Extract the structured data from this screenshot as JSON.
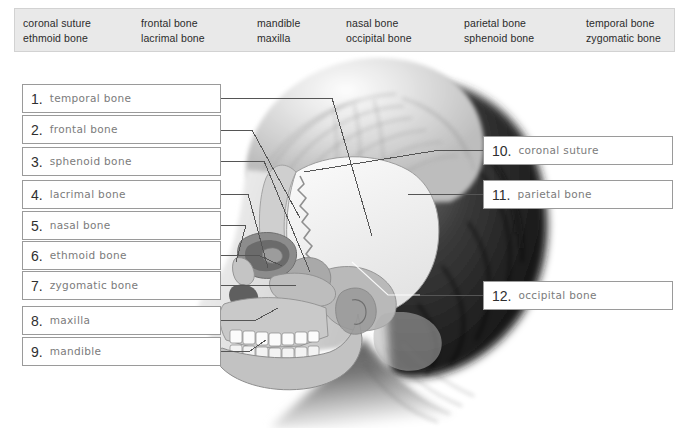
{
  "word_bank": {
    "columns": [
      {
        "x": 22,
        "words": [
          "coronal suture",
          "ethmoid bone"
        ]
      },
      {
        "x": 140,
        "words": [
          "frontal bone",
          "lacrimal bone"
        ]
      },
      {
        "x": 256,
        "words": [
          "mandible",
          "maxilla"
        ]
      },
      {
        "x": 345,
        "words": [
          "nasal bone",
          "occipital bone"
        ]
      },
      {
        "x": 463,
        "words": [
          "parietal bone",
          "sphenoid bone"
        ]
      },
      {
        "x": 585,
        "words": [
          "temporal bone",
          "zygomatic bone"
        ]
      }
    ]
  },
  "answers": {
    "left": [
      {
        "num": "1.",
        "text": "temporal bone",
        "x": 22,
        "y": 84,
        "w": 199,
        "h": 29
      },
      {
        "num": "2.",
        "text": "frontal bone",
        "x": 22,
        "y": 115,
        "w": 199,
        "h": 29
      },
      {
        "num": "3.",
        "text": "sphenoid bone",
        "x": 22,
        "y": 147,
        "w": 199,
        "h": 29
      },
      {
        "num": "4.",
        "text": "lacrimal bone",
        "x": 22,
        "y": 180,
        "w": 199,
        "h": 29
      },
      {
        "num": "5.",
        "text": "nasal bone",
        "x": 22,
        "y": 211,
        "w": 199,
        "h": 29
      },
      {
        "num": "6.",
        "text": "ethmoid bone",
        "x": 22,
        "y": 241,
        "w": 199,
        "h": 29
      },
      {
        "num": "7.",
        "text": "zygomatic bone",
        "x": 22,
        "y": 271,
        "w": 199,
        "h": 29
      },
      {
        "num": "8.",
        "text": "maxilla",
        "x": 22,
        "y": 306,
        "w": 199,
        "h": 29
      },
      {
        "num": "9.",
        "text": "mandible",
        "x": 22,
        "y": 337,
        "w": 199,
        "h": 29
      }
    ],
    "right": [
      {
        "num": "10.",
        "text": "coronal suture",
        "x": 483,
        "y": 136,
        "w": 190,
        "h": 29
      },
      {
        "num": "11.",
        "text": "parietal bone",
        "x": 483,
        "y": 180,
        "w": 190,
        "h": 29
      },
      {
        "num": "12.",
        "text": "occipital bone",
        "x": 483,
        "y": 281,
        "w": 190,
        "h": 29
      }
    ]
  },
  "colors": {
    "wordbank_bg": "#e9e9e9",
    "box_border": "#9a9a9a",
    "answer_text": "#7b7b7b",
    "number_text": "#2f2f2f",
    "leader_line": "#555555"
  }
}
